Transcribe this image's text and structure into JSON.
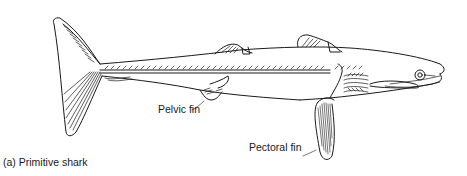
{
  "figure": {
    "subject": "Primitive shark",
    "caption": "(a) Primitive shark",
    "labels": {
      "pelvic_fin": "Pelvic fin",
      "pectoral_fin": "Pectoral fin"
    },
    "colors": {
      "line": "#1a1a1a",
      "background": "#ffffff"
    }
  }
}
